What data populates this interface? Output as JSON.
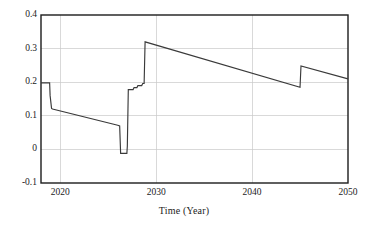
{
  "chart_data": {
    "type": "line",
    "title": "",
    "xlabel": "Time (Year)",
    "ylabel": "",
    "xlim": [
      2018,
      2050
    ],
    "ylim": [
      -0.1,
      0.4
    ],
    "grid": true,
    "legend": null,
    "x_ticks": [
      2020,
      2030,
      2040,
      2050
    ],
    "x_tick_labels": [
      "2020",
      "2030",
      "2040",
      "2050"
    ],
    "y_ticks": [
      -0.1,
      0,
      0.1,
      0.2,
      0.3,
      0.4
    ],
    "y_tick_labels": [
      "-0.1",
      "0",
      "0.1",
      "0.2",
      "0.3",
      "0.4"
    ],
    "series": [
      {
        "name": "value",
        "x": [
          2018.0,
          2018.9,
          2018.95,
          2019.1,
          2019.2,
          2026.0,
          2026.2,
          2026.3,
          2026.95,
          2027.0,
          2027.1,
          2027.6,
          2027.7,
          2028.0,
          2028.1,
          2028.5,
          2028.6,
          2028.75,
          2028.85,
          2045.0,
          2045.1,
          2050.0
        ],
        "y": [
          0.198,
          0.198,
          0.16,
          0.122,
          0.12,
          0.072,
          0.07,
          -0.012,
          -0.012,
          0.01,
          0.178,
          0.178,
          0.184,
          0.184,
          0.19,
          0.19,
          0.196,
          0.196,
          0.32,
          0.185,
          0.248,
          0.21
        ]
      }
    ],
    "annotations": []
  },
  "axis": {
    "x_title": "Time (Year)"
  },
  "frame": {
    "left": 41,
    "top": 15,
    "right": 348,
    "bottom": 183
  }
}
